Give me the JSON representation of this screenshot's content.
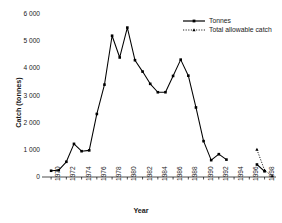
{
  "chart_data": {
    "type": "line",
    "title": "",
    "xlabel": "Year",
    "ylabel": "Catch (tonnes)",
    "xlim": [
      1969.2,
      1999.5
    ],
    "ylim": [
      0,
      6000
    ],
    "grid": false,
    "legend_position": "top-right",
    "ytick_labels": [
      "0",
      "1 000",
      "2 000",
      "3 000",
      "4 000",
      "5 000",
      "6 000"
    ],
    "ytick_values": [
      0,
      1000,
      2000,
      3000,
      4000,
      5000,
      6000
    ],
    "xtick_labels": [
      "1970",
      "1972",
      "1974",
      "1976",
      "1978",
      "1980",
      "1982",
      "1984",
      "1986",
      "1988",
      "1990",
      "1992",
      "1994",
      "1996",
      "1998"
    ],
    "xtick_values": [
      1970,
      1972,
      1974,
      1976,
      1978,
      1980,
      1982,
      1984,
      1986,
      1988,
      1990,
      1992,
      1994,
      1996,
      1998
    ],
    "series": [
      {
        "name": "Tonnes",
        "style": "solid",
        "marker": "square",
        "color": "#000000",
        "x": [
          1970,
          1971,
          1972,
          1973,
          1974,
          1975,
          1976,
          1977,
          1978,
          1979,
          1980,
          1981,
          1982,
          1983,
          1984,
          1985,
          1986,
          1987,
          1988,
          1989,
          1990,
          1991,
          1992,
          1993
        ],
        "values": [
          230,
          250,
          560,
          1220,
          950,
          980,
          2320,
          3400,
          5200,
          4400,
          5500,
          4300,
          3880,
          3430,
          3120,
          3120,
          3720,
          4320,
          3730,
          2560,
          1320,
          620,
          840,
          640
        ]
      },
      {
        "name": "Tonnes",
        "style": "solid",
        "marker": "square",
        "color": "#000000",
        "segment": "late",
        "x": [
          1997,
          1998
        ],
        "values": [
          460,
          210
        ]
      },
      {
        "name": "Total allowable catch",
        "style": "dotted",
        "marker": "triangle",
        "color": "#000000",
        "x": [
          1997,
          1998,
          1999
        ],
        "values": [
          1010,
          250,
          30
        ]
      }
    ],
    "legend": [
      {
        "label": "Tonnes",
        "style": "solid",
        "marker": "square"
      },
      {
        "label": "Total allowable catch",
        "style": "dotted",
        "marker": "triangle"
      }
    ]
  },
  "axes": {
    "y_title": "Catch (tonnes)",
    "x_title": "Year"
  },
  "legend": {
    "entry_tonnes": "Tonnes",
    "entry_tac": "Total allowable catch"
  },
  "yticks": {
    "t0": "0",
    "t1": "1 000",
    "t2": "2 000",
    "t3": "3 000",
    "t4": "4 000",
    "t5": "5 000",
    "t6": "6 000"
  },
  "xticks": {
    "t0": "1970",
    "t1": "1972",
    "t2": "1974",
    "t3": "1976",
    "t4": "1978",
    "t5": "1980",
    "t6": "1982",
    "t7": "1984",
    "t8": "1986",
    "t9": "1988",
    "t10": "1990",
    "t11": "1992",
    "t12": "1994",
    "t13": "1996",
    "t14": "1998"
  },
  "colors": {
    "line": "#000000",
    "text": "#1a1a1a",
    "background": "#ffffff"
  }
}
